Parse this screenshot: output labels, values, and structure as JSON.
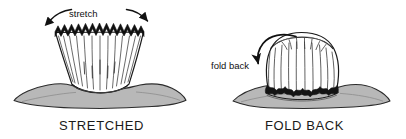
{
  "figure": {
    "background_color": "#ffffff",
    "ink_color": "#1a1a1a",
    "fabric_fill_color": "#ffffff",
    "surface_fill_color": "#b8b8b8",
    "surface_stroke_color": "#2b2b2b",
    "band_fill_color": "#101010"
  },
  "panels": [
    {
      "id": "stretched",
      "caption": "STRETCHED",
      "annotation": "stretch",
      "annotation_icon": "double-headed-curved-arrow-icon",
      "description": "Flared tube with serrated zigzag top edge resting on a surface"
    },
    {
      "id": "fold-back",
      "caption": "FOLD BACK",
      "annotation": "fold back",
      "annotation_icon": "curved-arrow-icon",
      "description": "Domed rolled-down cuff with scalloped dark lower edge resting on a surface"
    }
  ]
}
